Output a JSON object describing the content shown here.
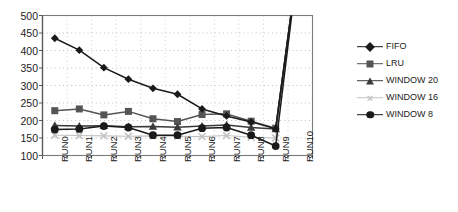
{
  "chart_data": {
    "type": "line",
    "title": "",
    "subtitle": "",
    "xlabel": "",
    "ylabel": "",
    "categories": [
      "RUN0",
      "RUN1",
      "RUN2",
      "RUN3",
      "RUN4",
      "RUN5",
      "RUN6",
      "RUN7",
      "RUN8",
      "RUN9",
      "RUN10"
    ],
    "ylim": [
      100,
      500
    ],
    "ytick_step": 50,
    "yticks": [
      500,
      450,
      400,
      350,
      300,
      250,
      200,
      150,
      100
    ],
    "grid": "horizontal-dotted",
    "legend_position": "right",
    "note": "All series rise steeply off the top of the plot at RUN10 (values exceed the 500 axis maximum and are clipped).",
    "series": [
      {
        "name": "FIFO",
        "marker": "diamond",
        "color": "#1a1a1a",
        "values": [
          435,
          401,
          351,
          318,
          292,
          275,
          233,
          213,
          196,
          176,
          700
        ]
      },
      {
        "name": "LRU",
        "marker": "square",
        "color": "#555555",
        "values": [
          228,
          233,
          216,
          226,
          205,
          197,
          217,
          219,
          198,
          178,
          700
        ]
      },
      {
        "name": "WINDOW 20",
        "marker": "triangle",
        "color": "#3a3a3a",
        "values": [
          186,
          184,
          185,
          182,
          183,
          181,
          184,
          187,
          180,
          176,
          700
        ]
      },
      {
        "name": "WINDOW 16",
        "marker": "cross",
        "color": "#c2c2c2",
        "values": [
          158,
          157,
          156,
          155,
          156,
          155,
          154,
          157,
          152,
          150,
          700
        ]
      },
      {
        "name": "WINDOW 8",
        "marker": "circle",
        "color": "#1a1a1a",
        "values": [
          174,
          176,
          184,
          180,
          158,
          158,
          178,
          180,
          158,
          127,
          700
        ]
      }
    ]
  },
  "legend": {
    "entries": [
      {
        "label": "FIFO"
      },
      {
        "label": "LRU"
      },
      {
        "label": "WINDOW 20"
      },
      {
        "label": "WINDOW 16"
      },
      {
        "label": "WINDOW 8"
      }
    ]
  },
  "axes": {
    "y_labels": [
      "500",
      "450",
      "400",
      "350",
      "300",
      "250",
      "200",
      "150",
      "100"
    ],
    "x_labels": [
      "RUN0",
      "RUN1",
      "RUN2",
      "RUN3",
      "RUN4",
      "RUN5",
      "RUN6",
      "RUN7",
      "RUN8",
      "RUN9",
      "RUN10"
    ]
  }
}
